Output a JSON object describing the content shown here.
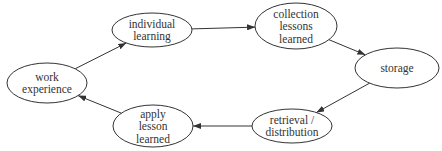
{
  "diagram": {
    "type": "cycle",
    "colors": {
      "stroke": "#333333",
      "background": "#ffffff",
      "text": "#333333"
    },
    "nodes": [
      {
        "id": "work",
        "lines": [
          "work",
          "experience"
        ],
        "cx": 47,
        "cy": 83,
        "rx": 40,
        "ry": 20
      },
      {
        "id": "individual",
        "lines": [
          "individual",
          "learning"
        ],
        "cx": 152,
        "cy": 30,
        "rx": 40,
        "ry": 17
      },
      {
        "id": "collection",
        "lines": [
          "collection",
          "lessons",
          "learned"
        ],
        "cx": 296,
        "cy": 26,
        "rx": 41,
        "ry": 23
      },
      {
        "id": "storage",
        "lines": [
          "storage"
        ],
        "cx": 397,
        "cy": 68,
        "rx": 42,
        "ry": 20
      },
      {
        "id": "retrieval",
        "lines": [
          "retrieval /",
          "distribution"
        ],
        "cx": 292,
        "cy": 126,
        "rx": 40,
        "ry": 17
      },
      {
        "id": "apply",
        "lines": [
          "apply",
          "lesson",
          "learned"
        ],
        "cx": 153,
        "cy": 126,
        "rx": 40,
        "ry": 21
      }
    ],
    "edges": [
      {
        "from": "work",
        "to": "individual"
      },
      {
        "from": "individual",
        "to": "collection"
      },
      {
        "from": "collection",
        "to": "storage"
      },
      {
        "from": "storage",
        "to": "retrieval"
      },
      {
        "from": "retrieval",
        "to": "apply"
      },
      {
        "from": "apply",
        "to": "work"
      }
    ]
  }
}
